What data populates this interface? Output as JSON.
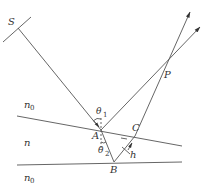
{
  "diagram": {
    "type": "thin-film-interference",
    "colors": {
      "line": "#555555",
      "text": "#333333",
      "background": "#ffffff"
    },
    "labels": {
      "source": "S",
      "point_p": "P",
      "point_a": "A",
      "point_b": "B",
      "point_c": "C",
      "theta1": "θ",
      "theta1_sub": "1",
      "theta2": "θ",
      "theta2_sub": "2",
      "thickness": "h",
      "medium_top": "n",
      "medium_top_sub": "0",
      "medium_film": "n",
      "medium_bottom": "n",
      "medium_bottom_sub": "0"
    },
    "nodes": [
      {
        "id": "S",
        "x": 18,
        "y": 28
      },
      {
        "id": "A",
        "x": 101,
        "y": 130
      },
      {
        "id": "B",
        "x": 114,
        "y": 162
      },
      {
        "id": "C",
        "x": 135,
        "y": 136
      },
      {
        "id": "P",
        "x": 162,
        "y": 69
      }
    ],
    "edges": [
      {
        "from": "S",
        "to": "A",
        "kind": "incident-ray"
      },
      {
        "from": "A",
        "to": "P",
        "kind": "reflected-ray",
        "arrow": true
      },
      {
        "from": "A",
        "to": "B",
        "kind": "refracted-ray"
      },
      {
        "from": "B",
        "to": "C",
        "kind": "reflected-ray"
      },
      {
        "from": "C",
        "to": "P",
        "kind": "emergent-ray",
        "arrow": true
      }
    ],
    "interfaces": [
      {
        "name": "top-surface",
        "from": [
          17,
          116
        ],
        "to": [
          182,
          146
        ]
      },
      {
        "name": "bottom-surface",
        "from": [
          17,
          165
        ],
        "to": [
          182,
          162
        ]
      }
    ]
  }
}
